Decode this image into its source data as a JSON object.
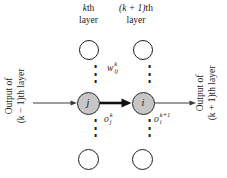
{
  "diagram": {
    "top_labels": {
      "left": {
        "var": "k",
        "suffix": "th",
        "line2": "layer"
      },
      "right": {
        "var": "(k + 1)",
        "suffix": "th",
        "line2": "layer"
      }
    },
    "side_labels": {
      "left": {
        "line1": "Output of",
        "line2": "(k − 1)th layer"
      },
      "right": {
        "line1": "Output of",
        "line2": "(k + 1)th layer"
      }
    },
    "weight_label": {
      "base": "w",
      "sup": "k",
      "sub": "ij"
    },
    "output_labels": {
      "j": {
        "base": "o",
        "sup": "k",
        "sub": "j"
      },
      "i": {
        "base": "o",
        "sup": "k+1",
        "sub": "i"
      }
    },
    "nodes": {
      "j": "j",
      "i": "i"
    },
    "ellipsis": "⋮",
    "colors": {
      "background": "#ffffff",
      "active_node_fill": "#c6c6c6",
      "node_stroke": "#1f1f1f",
      "text": "#1a1a1a",
      "arrow_thin": "#3c3c3c",
      "arrow_thick": "#111111"
    }
  }
}
